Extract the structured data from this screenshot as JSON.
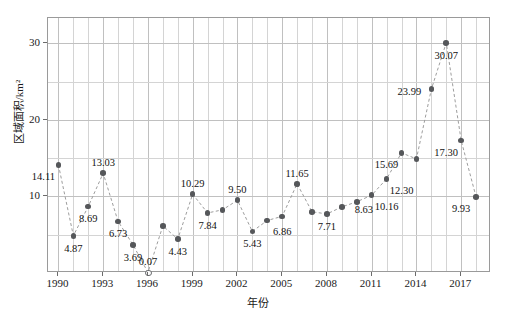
{
  "chart_data": {
    "type": "line",
    "title": "",
    "xlabel": "年份",
    "ylabel": "区域面积/km²",
    "xlim": [
      1989.3,
      1919.0
    ],
    "x_range": [
      1989.3,
      2019.0
    ],
    "ylim": [
      0,
      33.3
    ],
    "grid": true,
    "legend": null,
    "x_major_ticks": [
      1990,
      1993,
      1996,
      1999,
      2002,
      2005,
      2008,
      2011,
      2014,
      2017
    ],
    "x_tick_labels": [
      "1990",
      "1993",
      "1996",
      "1999",
      "2002",
      "2005",
      "2008",
      "2011",
      "2014",
      "2017"
    ],
    "y_major_ticks": [
      10,
      20,
      30
    ],
    "y_tick_labels": [
      "10",
      "20",
      "30"
    ],
    "y_minor_ticks": [
      5,
      15,
      25
    ],
    "marker_color": "#55575a",
    "line_color": "#9d9d9d",
    "line_style": "dashed",
    "x": [
      1990,
      1991,
      1992,
      1993,
      1994,
      1995,
      1996,
      1997,
      1998,
      1999,
      2000,
      2001,
      2002,
      2003,
      2004,
      2005,
      2006,
      2007,
      2008,
      2009,
      2010,
      2011,
      2012,
      2013,
      2014,
      2015,
      2016,
      2017,
      2018
    ],
    "values": [
      14.11,
      4.87,
      8.69,
      13.03,
      6.73,
      3.69,
      0.07,
      6.15,
      4.43,
      10.29,
      7.84,
      8.25,
      9.5,
      5.43,
      6.86,
      7.4,
      11.65,
      8.0,
      7.71,
      8.63,
      9.3,
      10.16,
      12.3,
      15.69,
      14.9,
      23.99,
      30.07,
      17.3,
      9.93
    ],
    "point_labels": [
      {
        "x": 1990,
        "y": 14.11,
        "text": "14.11",
        "pos": "below-left"
      },
      {
        "x": 1991,
        "y": 4.87,
        "text": "4.87",
        "pos": "below"
      },
      {
        "x": 1992,
        "y": 8.69,
        "text": "8.69",
        "pos": "below"
      },
      {
        "x": 1993,
        "y": 13.03,
        "text": "13.03",
        "pos": "above"
      },
      {
        "x": 1994,
        "y": 6.73,
        "text": "6.73",
        "pos": "below"
      },
      {
        "x": 1995,
        "y": 3.69,
        "text": "3.69",
        "pos": "below"
      },
      {
        "x": 1996,
        "y": 0.07,
        "text": "0.07",
        "pos": "above",
        "hollow": true
      },
      {
        "x": 1998,
        "y": 4.43,
        "text": "4.43",
        "pos": "below"
      },
      {
        "x": 1999,
        "y": 10.29,
        "text": "10.29",
        "pos": "above"
      },
      {
        "x": 2000,
        "y": 7.84,
        "text": "7.84",
        "pos": "below"
      },
      {
        "x": 2002,
        "y": 9.5,
        "text": "9.50",
        "pos": "above"
      },
      {
        "x": 2003,
        "y": 5.43,
        "text": "5.43",
        "pos": "below"
      },
      {
        "x": 2004,
        "y": 6.86,
        "text": "6.86",
        "pos": "below-right"
      },
      {
        "x": 2006,
        "y": 11.65,
        "text": "11.65",
        "pos": "above"
      },
      {
        "x": 2008,
        "y": 7.71,
        "text": "7.71",
        "pos": "below"
      },
      {
        "x": 2009,
        "y": 8.63,
        "text": "8.63",
        "pos": "right"
      },
      {
        "x": 2011,
        "y": 10.16,
        "text": "10.16",
        "pos": "below-right"
      },
      {
        "x": 2012,
        "y": 12.3,
        "text": "12.30",
        "pos": "below-right"
      },
      {
        "x": 2013,
        "y": 15.69,
        "text": "15.69",
        "pos": "below-left"
      },
      {
        "x": 2015,
        "y": 23.99,
        "text": "23.99",
        "pos": "left"
      },
      {
        "x": 2016,
        "y": 30.07,
        "text": "30.07",
        "pos": "below"
      },
      {
        "x": 2017,
        "y": 17.3,
        "text": "17.30",
        "pos": "below-left"
      },
      {
        "x": 2018,
        "y": 9.93,
        "text": "9.93",
        "pos": "below-left"
      }
    ]
  }
}
